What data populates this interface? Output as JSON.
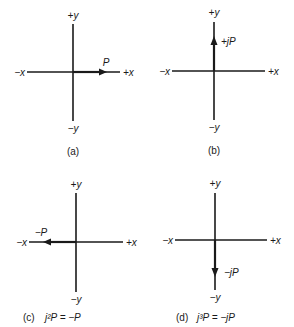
{
  "figure": {
    "panels": [
      {
        "id": "a",
        "axis_labels": {
          "pos_y": "+y",
          "neg_y": "−y",
          "neg_x": "−x",
          "pos_x": "+x"
        },
        "vector": {
          "label": "P",
          "direction": "+x"
        },
        "caption": {
          "tag": "(a)",
          "equation": ""
        }
      },
      {
        "id": "b",
        "axis_labels": {
          "pos_y": "+y",
          "neg_y": "−y",
          "neg_x": "−x",
          "pos_x": "+x"
        },
        "vector": {
          "label": "+jP",
          "direction": "+y"
        },
        "caption": {
          "tag": "(b)",
          "equation": ""
        }
      },
      {
        "id": "c",
        "axis_labels": {
          "pos_y": "+y",
          "neg_y": "−y",
          "neg_x": "−x",
          "pos_x": "+x"
        },
        "vector": {
          "label": "−P",
          "direction": "-x"
        },
        "caption": {
          "tag": "(c)",
          "equation": "j²P  =  −P"
        }
      },
      {
        "id": "d",
        "axis_labels": {
          "pos_y": "+y",
          "neg_y": "−y",
          "neg_x": "−x",
          "pos_x": "+x"
        },
        "vector": {
          "label": "−jP",
          "direction": "-y"
        },
        "caption": {
          "tag": "(d)",
          "equation": "j³P  =  −jP"
        }
      }
    ]
  }
}
